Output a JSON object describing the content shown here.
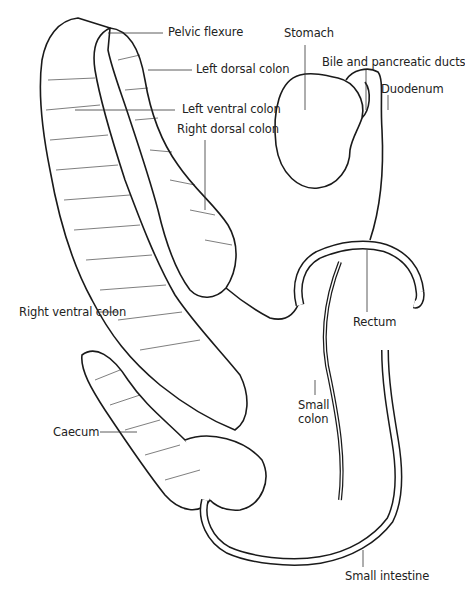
{
  "diagram": {
    "labels": [
      {
        "id": "pelvic-flexure",
        "text": "Pelvic flexure"
      },
      {
        "id": "left-dorsal-colon",
        "text": "Left dorsal colon"
      },
      {
        "id": "left-ventral-colon",
        "text": "Left ventral colon"
      },
      {
        "id": "right-dorsal-colon",
        "text": "Right dorsal colon"
      },
      {
        "id": "stomach",
        "text": "Stomach"
      },
      {
        "id": "bile-pancreatic-ducts",
        "text": "Bile and pancreatic ducts"
      },
      {
        "id": "duodenum",
        "text": "Duodenum"
      },
      {
        "id": "right-ventral-colon",
        "text": "Right ventral colon"
      },
      {
        "id": "rectum",
        "text": "Rectum"
      },
      {
        "id": "small-colon",
        "text": "Small colon",
        "lines": [
          "Small",
          "colon"
        ]
      },
      {
        "id": "caecum",
        "text": "Caecum"
      },
      {
        "id": "small-intestine",
        "text": "Small intestine"
      }
    ],
    "colors": {
      "ink": "#1a1a1a",
      "background": "#ffffff",
      "text": "#222222"
    }
  }
}
